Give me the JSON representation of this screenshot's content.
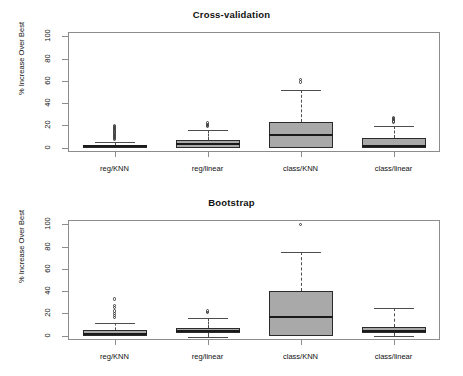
{
  "figure": {
    "width": 463,
    "height": 376,
    "ylabel": "% Increase Over Best",
    "box_fill_color": "#a9a9a9",
    "box_border_color": "#2b2b2b",
    "frame_color": "#8c8c8c"
  },
  "chart_data": [
    {
      "type": "box",
      "title": "Cross-validation",
      "xlabel": "",
      "ylabel": "% Increase Over Best",
      "ylim": [
        -4,
        104
      ],
      "yticks": [
        0,
        20,
        40,
        60,
        80,
        100
      ],
      "grid": false,
      "legend": "none",
      "categories": [
        "reg/KNN",
        "reg/linear",
        "class/KNN",
        "class/linear"
      ],
      "boxes": [
        {
          "category": "reg/KNN",
          "whisker_low": 0,
          "q1": 0,
          "median": 1,
          "q3": 2,
          "whisker_high": 5,
          "outliers": [
            7,
            8,
            9,
            10,
            11,
            12,
            13,
            14,
            15,
            16,
            17,
            18,
            19,
            20
          ]
        },
        {
          "category": "reg/linear",
          "whisker_low": 0,
          "q1": 0,
          "median": 3,
          "q3": 7,
          "whisker_high": 16,
          "outliers": [
            19,
            20,
            21,
            22
          ]
        },
        {
          "category": "class/KNN",
          "whisker_low": 0,
          "q1": 0,
          "median": 11,
          "q3": 23,
          "whisker_high": 52,
          "outliers": [
            59,
            61
          ]
        },
        {
          "category": "class/linear",
          "whisker_low": 0,
          "q1": 0,
          "median": 1,
          "q3": 9,
          "whisker_high": 19,
          "outliers": [
            23,
            24,
            25,
            26,
            27
          ]
        }
      ]
    },
    {
      "type": "box",
      "title": "Bootstrap",
      "xlabel": "",
      "ylabel": "% Increase Over Best",
      "ylim": [
        -4,
        104
      ],
      "yticks": [
        0,
        20,
        40,
        60,
        80,
        100
      ],
      "grid": false,
      "legend": "none",
      "categories": [
        "reg/KNN",
        "reg/linear",
        "class/KNN",
        "class/linear"
      ],
      "boxes": [
        {
          "category": "reg/KNN",
          "whisker_low": 0,
          "q1": 0,
          "median": 1,
          "q3": 5,
          "whisker_high": 11,
          "outliers": [
            16,
            18,
            20,
            22,
            25,
            27,
            33
          ]
        },
        {
          "category": "reg/linear",
          "whisker_low": -1,
          "q1": 2,
          "median": 4,
          "q3": 7,
          "whisker_high": 16,
          "outliers": [
            21,
            22
          ]
        },
        {
          "category": "class/KNN",
          "whisker_low": 0,
          "q1": 0,
          "median": 17,
          "q3": 40,
          "whisker_high": 75,
          "outliers": [
            100
          ]
        },
        {
          "category": "class/linear",
          "whisker_low": 0,
          "q1": 2,
          "median": 4,
          "q3": 8,
          "whisker_high": 25,
          "outliers": []
        }
      ]
    }
  ]
}
